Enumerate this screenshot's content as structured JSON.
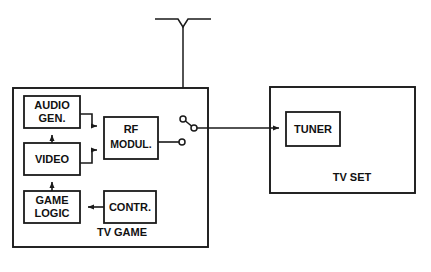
{
  "figure": {
    "kind": "block-diagram"
  },
  "blocks": [
    {
      "id": "audio_gen",
      "label_line1": "AUDIO",
      "label_line2": "GEN.",
      "x": 24,
      "y": 96,
      "w": 56,
      "h": 32
    },
    {
      "id": "video",
      "label_line1": "VIDEO",
      "label_line2": "",
      "x": 24,
      "y": 143,
      "w": 56,
      "h": 32
    },
    {
      "id": "game_logic",
      "label_line1": "GAME",
      "label_line2": "LOGIC",
      "x": 24,
      "y": 191,
      "w": 56,
      "h": 32
    },
    {
      "id": "contr",
      "label_line1": "CONTR.",
      "label_line2": "",
      "x": 104,
      "y": 191,
      "w": 52,
      "h": 32
    },
    {
      "id": "rf_modul",
      "label_line1": "RF",
      "label_line2": "MODUL.",
      "x": 104,
      "y": 117,
      "w": 54,
      "h": 42
    },
    {
      "id": "tuner",
      "label_line1": "TUNER",
      "label_line2": "",
      "x": 286,
      "y": 112,
      "w": 54,
      "h": 34
    }
  ],
  "enclosures": [
    {
      "id": "tv_game",
      "label": "TV GAME",
      "x": 13,
      "y": 88,
      "w": 195,
      "h": 159,
      "label_x": 122,
      "label_y": 236
    },
    {
      "id": "tv_set",
      "label": "TV SET",
      "x": 270,
      "y": 87,
      "w": 145,
      "h": 106,
      "label_x": 352,
      "label_y": 181
    }
  ],
  "antenna": {
    "name": "dipole-antenna",
    "left_arm_x1": 155,
    "left_arm_x2": 178,
    "right_arm_x1": 188,
    "right_arm_x2": 211,
    "arm_y": 19,
    "vertex_x": 183,
    "vertex_y": 27,
    "mast_bottom_y": 119
  },
  "switch": {
    "name": "antenna-changeover-switch",
    "contact_antenna": {
      "cx": 183,
      "cy": 119,
      "r": 3
    },
    "contact_pole": {
      "cx": 194,
      "cy": 128,
      "r": 3
    },
    "contact_rf": {
      "cx": 182,
      "cy": 142,
      "r": 3
    },
    "blade_from_x": 183,
    "blade_from_y": 119,
    "blade_to_x": 194,
    "blade_to_y": 128
  },
  "connections": [
    {
      "id": "game_logic_to_video",
      "from": "game_logic",
      "to": "video",
      "arrow": true
    },
    {
      "id": "video_to_audio_gen",
      "from": "video",
      "to": "audio_gen",
      "arrow": true
    },
    {
      "id": "contr_to_game_logic",
      "from": "contr",
      "to": "game_logic",
      "arrow": true
    },
    {
      "id": "audio_gen_to_rf",
      "from": "audio_gen",
      "to": "rf_modul",
      "arrow": true
    },
    {
      "id": "video_to_rf",
      "from": "video",
      "to": "rf_modul",
      "arrow": true
    },
    {
      "id": "rf_to_switch",
      "from": "rf_modul",
      "to": "switch-contact-rf",
      "arrow": false
    },
    {
      "id": "switch_to_tuner",
      "from": "switch-pole",
      "to": "tuner",
      "arrow": true
    },
    {
      "id": "antenna_to_switch",
      "from": "antenna",
      "to": "switch-contact-antenna",
      "arrow": false
    }
  ],
  "colors": {
    "ink": "#1a1a1a",
    "paper": "#ffffff"
  }
}
